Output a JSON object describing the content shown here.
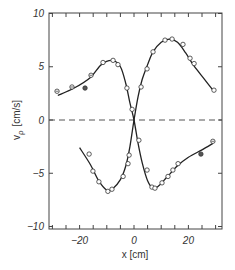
{
  "chart_data": {
    "type": "scatter",
    "title": "",
    "xlabel": "x  [cm]",
    "ylabel": "v_ρ  [cm/s]",
    "xlim": [
      -31,
      32
    ],
    "ylim": [
      -10,
      10
    ],
    "xticks": [
      -20,
      0,
      20
    ],
    "xtick_labels": [
      "−20",
      "0",
      "20"
    ],
    "xminor_ticks": [
      -30,
      -25,
      -15,
      -10,
      -5,
      5,
      10,
      15,
      25,
      30
    ],
    "yticks": [
      10,
      5,
      0,
      -5,
      -10
    ],
    "ytick_labels": [
      "10",
      "5",
      "0",
      "−5",
      "−10"
    ],
    "grid": false,
    "legend": null,
    "reference_line": {
      "y": 0,
      "style": "dashed"
    },
    "series": [
      {
        "name": "curve-1 (peak left, trough right)",
        "marker": "circle-open",
        "fit_curve": [
          [
            -28,
            2.3
          ],
          [
            -22,
            3.0
          ],
          [
            -16,
            4.0
          ],
          [
            -12,
            5.2
          ],
          [
            -8,
            5.6
          ],
          [
            -5,
            5.0
          ],
          [
            -3,
            3.4
          ],
          [
            -1.5,
            1.6
          ],
          [
            0,
            0
          ],
          [
            1.5,
            -2.2
          ],
          [
            3,
            -4.0
          ],
          [
            5,
            -5.7
          ],
          [
            7,
            -6.4
          ],
          [
            9,
            -6.2
          ],
          [
            12,
            -5.4
          ],
          [
            16,
            -4.3
          ],
          [
            20,
            -3.5
          ],
          [
            25,
            -2.8
          ],
          [
            29,
            -2.2
          ]
        ],
        "points": [
          {
            "x": -28.3,
            "y": 2.7,
            "marker": "crossed"
          },
          {
            "x": -22.8,
            "y": 3.1,
            "marker": "crossed"
          },
          {
            "x": -18.0,
            "y": 3.0,
            "marker": "filled"
          },
          {
            "x": -15.8,
            "y": 4.2,
            "marker": "crossed"
          },
          {
            "x": -11.4,
            "y": 5.4
          },
          {
            "x": -7.7,
            "y": 5.6
          },
          {
            "x": -5.9,
            "y": 5.2
          },
          {
            "x": -2.6,
            "y": 3.0
          },
          {
            "x": -0.7,
            "y": 1.0
          },
          {
            "x": 1.8,
            "y": -1.9
          },
          {
            "x": 4.8,
            "y": -4.7
          },
          {
            "x": 6.6,
            "y": -6.3
          },
          {
            "x": 7.7,
            "y": -6.4
          },
          {
            "x": 10.3,
            "y": -5.9
          },
          {
            "x": 12.5,
            "y": -5.3
          },
          {
            "x": 14.3,
            "y": -4.7
          },
          {
            "x": 16.2,
            "y": -4.1
          },
          {
            "x": 24.6,
            "y": -3.2,
            "marker": "filled"
          },
          {
            "x": 29.0,
            "y": -2.0,
            "marker": "crossed"
          }
        ]
      },
      {
        "name": "curve-2 (trough left, peak right)",
        "marker": "circle-open",
        "fit_curve": [
          [
            -20,
            -2.6
          ],
          [
            -16,
            -4.2
          ],
          [
            -13,
            -5.7
          ],
          [
            -10,
            -6.6
          ],
          [
            -8,
            -6.5
          ],
          [
            -5,
            -5.6
          ],
          [
            -3,
            -4.3
          ],
          [
            -1.5,
            -2.5
          ],
          [
            0,
            0
          ],
          [
            1.5,
            2.2
          ],
          [
            3,
            3.8
          ],
          [
            5,
            5.2
          ],
          [
            7,
            6.4
          ],
          [
            10,
            7.3
          ],
          [
            13,
            7.6
          ],
          [
            16,
            7.3
          ],
          [
            19,
            6.3
          ],
          [
            22,
            5.1
          ],
          [
            26,
            3.8
          ],
          [
            29,
            2.8
          ]
        ],
        "points": [
          {
            "x": -16.5,
            "y": -3.2
          },
          {
            "x": -15.1,
            "y": -4.8
          },
          {
            "x": -12.9,
            "y": -5.8
          },
          {
            "x": -9.6,
            "y": -6.7
          },
          {
            "x": -8.1,
            "y": -6.5
          },
          {
            "x": -4.0,
            "y": -5.3
          },
          {
            "x": -2.2,
            "y": -4.1
          },
          {
            "x": -1.8,
            "y": -3.3
          },
          {
            "x": 2.6,
            "y": 3.1
          },
          {
            "x": 4.8,
            "y": 4.8
          },
          {
            "x": 7.0,
            "y": 6.4
          },
          {
            "x": 11.4,
            "y": 7.5
          },
          {
            "x": 14.0,
            "y": 7.6
          },
          {
            "x": 18.0,
            "y": 7.1
          },
          {
            "x": 20.6,
            "y": 5.8
          },
          {
            "x": 22.1,
            "y": 5.3
          },
          {
            "x": 29.4,
            "y": 2.8
          }
        ]
      }
    ]
  },
  "labels": {
    "xlabel": "x  [cm]",
    "ylabel_main": "v",
    "ylabel_sub": "ρ",
    "ylabel_unit": "[cm/s]"
  }
}
